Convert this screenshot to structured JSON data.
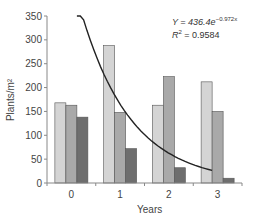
{
  "chart_data": {
    "type": "bar",
    "title": "",
    "xlabel": "Years",
    "ylabel": "Plants/m²",
    "categories": [
      "0",
      "1",
      "2",
      "3"
    ],
    "series": [
      {
        "name": "Series 1",
        "color": "#d4d4d4",
        "values": [
          168,
          288,
          163,
          212
        ]
      },
      {
        "name": "Series 2",
        "color": "#a9a9a9",
        "values": [
          163,
          148,
          223,
          150
        ]
      },
      {
        "name": "Series 3",
        "color": "#6e6e6e",
        "values": [
          138,
          72,
          32,
          10
        ]
      }
    ],
    "trendline": {
      "type": "exponential",
      "equation": "Y = 436.4e^-0.972x",
      "a": 436.4,
      "b": -0.972,
      "r_squared": "R² = 0.9584"
    },
    "ylim": [
      0,
      350
    ],
    "yticks": [
      0,
      50,
      100,
      150,
      200,
      250,
      300,
      350
    ],
    "grid": false,
    "legend": "none"
  },
  "annotation": {
    "eq_prefix": "Y = 436.4e",
    "eq_exp": "−0.972x",
    "r2_prefix": "R",
    "r2_sup": "2",
    "r2_value": " = 0.9584"
  }
}
